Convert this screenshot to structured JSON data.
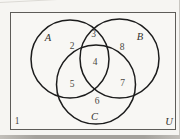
{
  "venn": {
    "title": "Three-set Venn diagram with numbered regions",
    "universe_label": "U",
    "set_a_label": "A",
    "set_b_label": "B",
    "set_c_label": "C",
    "region_outside": "1",
    "region_a_only": "2",
    "region_a_and_b": "3",
    "region_a_b_c": "4",
    "region_a_and_c": "5",
    "region_c_only": "6",
    "region_b_and_c": "7",
    "region_b_only": "8",
    "colors": {
      "circle_line": "#1c1c1c",
      "frame_line": "#5e5c58",
      "paper": "#f6f5f2",
      "label_text": "#35332f",
      "number_text": "#4a4742"
    }
  }
}
